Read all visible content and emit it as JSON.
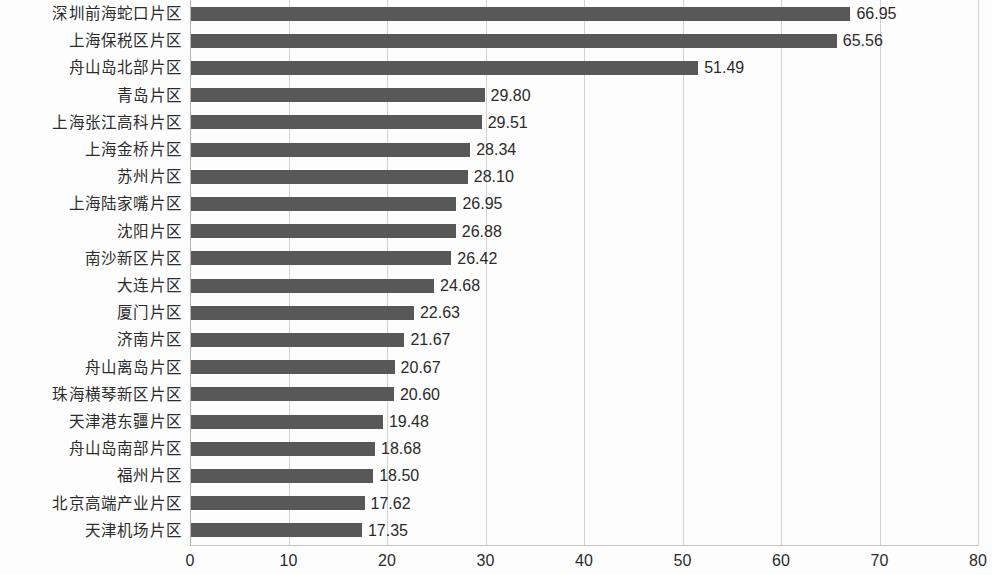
{
  "chart_data": {
    "type": "bar",
    "orientation": "horizontal",
    "title": "",
    "subtitle": "",
    "xlabel": "",
    "ylabel": "",
    "xlim": [
      0,
      80
    ],
    "xticks": [
      "0",
      "10",
      "20",
      "30",
      "40",
      "50",
      "60",
      "70",
      "80"
    ],
    "grid": "vertical",
    "legend": "none",
    "bar_color": "#585858",
    "gridline_color": "#d2d2d2",
    "background_color": "#fdfdfd",
    "categories": [
      "深圳前海蛇口片区",
      "上海保税区片区",
      "舟山岛北部片区",
      "青岛片区",
      "上海张江高科片区",
      "上海金桥片区",
      "苏州片区",
      "上海陆家嘴片区",
      "沈阳片区",
      "南沙新区片区",
      "大连片区",
      "厦门片区",
      "济南片区",
      "舟山离岛片区",
      "珠海横琴新区片区",
      "天津港东疆片区",
      "舟山岛南部片区",
      "福州片区",
      "北京高端产业片区",
      "天津机场片区"
    ],
    "values": [
      66.95,
      65.56,
      51.49,
      29.8,
      29.51,
      28.34,
      28.1,
      26.95,
      26.88,
      26.42,
      24.68,
      22.63,
      21.67,
      20.67,
      20.6,
      19.48,
      18.68,
      18.5,
      17.62,
      17.35
    ],
    "value_labels": [
      "66.95",
      "65.56",
      "51.49",
      "29.80",
      "29.51",
      "28.34",
      "28.10",
      "26.95",
      "26.88",
      "26.42",
      "24.68",
      "22.63",
      "21.67",
      "20.67",
      "20.60",
      "19.48",
      "18.68",
      "18.50",
      "17.62",
      "17.35"
    ]
  }
}
